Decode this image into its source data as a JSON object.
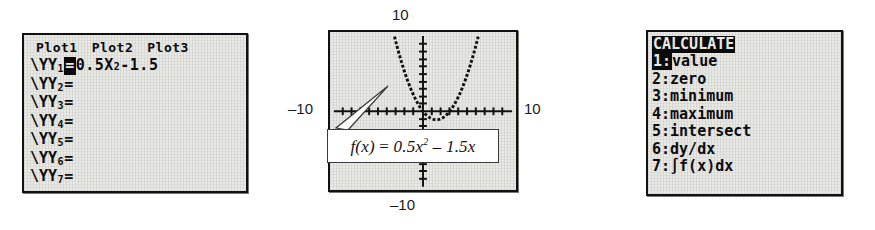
{
  "panels": {
    "y_editor": {
      "name": "Y= equation editor",
      "plot_tabs": [
        {
          "label": "Plot1"
        },
        {
          "label": "Plot2"
        },
        {
          "label": "Plot3"
        }
      ],
      "rows": [
        {
          "name": "Y1",
          "sub": "1",
          "equals": "=",
          "selected": true,
          "expr_prefix": "0.5X",
          "expr_sup": "2",
          "expr_suffix": "-1.5",
          "expr_full": "0.5X²-1.5"
        },
        {
          "name": "Y2",
          "sub": "2",
          "equals": "=",
          "selected": false,
          "expr_full": ""
        },
        {
          "name": "Y3",
          "sub": "3",
          "equals": "=",
          "selected": false,
          "expr_full": ""
        },
        {
          "name": "Y4",
          "sub": "4",
          "equals": "=",
          "selected": false,
          "expr_full": ""
        },
        {
          "name": "Y5",
          "sub": "5",
          "equals": "=",
          "selected": false,
          "expr_full": ""
        },
        {
          "name": "Y6",
          "sub": "6",
          "equals": "=",
          "selected": false,
          "expr_full": ""
        },
        {
          "name": "Y7",
          "sub": "7",
          "equals": "=",
          "selected": false,
          "expr_full": ""
        }
      ],
      "row_prefix": "\\Y"
    },
    "graph": {
      "name": "Graph of f(x)",
      "labels": {
        "y_max": "10",
        "y_min": "–10",
        "x_min": "–10",
        "x_max": "10"
      },
      "callout": {
        "fx": "f(x)",
        "equals": "=",
        "coef_a": "0.5x",
        "power": "2",
        "minus": "–",
        "coef_b": "1.5x",
        "full": "f(x) = 0.5x² – 1.5x"
      }
    },
    "calc_menu": {
      "name": "CALCULATE menu",
      "title": "CALCULATE",
      "items": [
        {
          "num": "1:",
          "label": "value",
          "highlighted": true
        },
        {
          "num": "2:",
          "label": "zero",
          "highlighted": false
        },
        {
          "num": "3:",
          "label": "minimum",
          "highlighted": false
        },
        {
          "num": "4:",
          "label": "maximum",
          "highlighted": false
        },
        {
          "num": "5:",
          "label": "intersect",
          "highlighted": false
        },
        {
          "num": "6:",
          "label": "dy/dx",
          "highlighted": false
        },
        {
          "num": "7:",
          "label": "∫f(x)dx",
          "highlighted": false
        }
      ]
    }
  },
  "chart_data": {
    "type": "line",
    "title": "",
    "xlabel": "",
    "ylabel": "",
    "xlim": [
      -10,
      10
    ],
    "ylim": [
      -10,
      10
    ],
    "grid": false,
    "tick_spacing": 1,
    "legend": "none",
    "annotations": [
      {
        "text": "f(x) = 0.5x² – 1.5x",
        "type": "callout-box"
      }
    ],
    "series": [
      {
        "name": "f(x) = 0.5x² – 1.5x",
        "equation": "0.5*x^2 - 1.5*x",
        "style": "dotted-pixel",
        "x": [
          -4,
          -3.5,
          -3,
          -2.5,
          -2,
          -1.5,
          -1,
          -0.5,
          0,
          0.5,
          1,
          1.5,
          2,
          2.5,
          3,
          3.5,
          4,
          4.5,
          5,
          5.5,
          6
        ],
        "y": [
          14,
          11.375,
          9,
          6.875,
          5,
          3.375,
          2,
          0.875,
          0,
          -0.625,
          -1,
          -1.125,
          -1,
          -0.625,
          0,
          0.875,
          2,
          3.375,
          5,
          6.875,
          9
        ]
      }
    ]
  },
  "colors": {
    "lcd_background": "#e8e8e4",
    "lcd_ink": "#0b0b0b",
    "frame": "#111111",
    "callout_background": "#ffffff",
    "page_background": "#ffffff"
  }
}
